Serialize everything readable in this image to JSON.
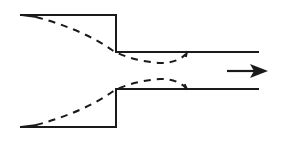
{
  "diagram": {
    "type": "sudden-contraction-flow",
    "colors": {
      "line": "#1a1a1a",
      "background": "#ffffff"
    },
    "elements": [
      {
        "name": "large-pipe-upper-wall",
        "style": "solid"
      },
      {
        "name": "step-upper",
        "style": "solid"
      },
      {
        "name": "small-pipe-upper-wall",
        "style": "solid"
      },
      {
        "name": "small-pipe-lower-wall",
        "style": "solid"
      },
      {
        "name": "step-lower",
        "style": "solid"
      },
      {
        "name": "large-pipe-lower-wall",
        "style": "solid"
      },
      {
        "name": "upper-streamline",
        "style": "dashed"
      },
      {
        "name": "lower-streamline",
        "style": "dashed"
      },
      {
        "name": "flow-direction-arrow",
        "direction": "right"
      }
    ]
  }
}
